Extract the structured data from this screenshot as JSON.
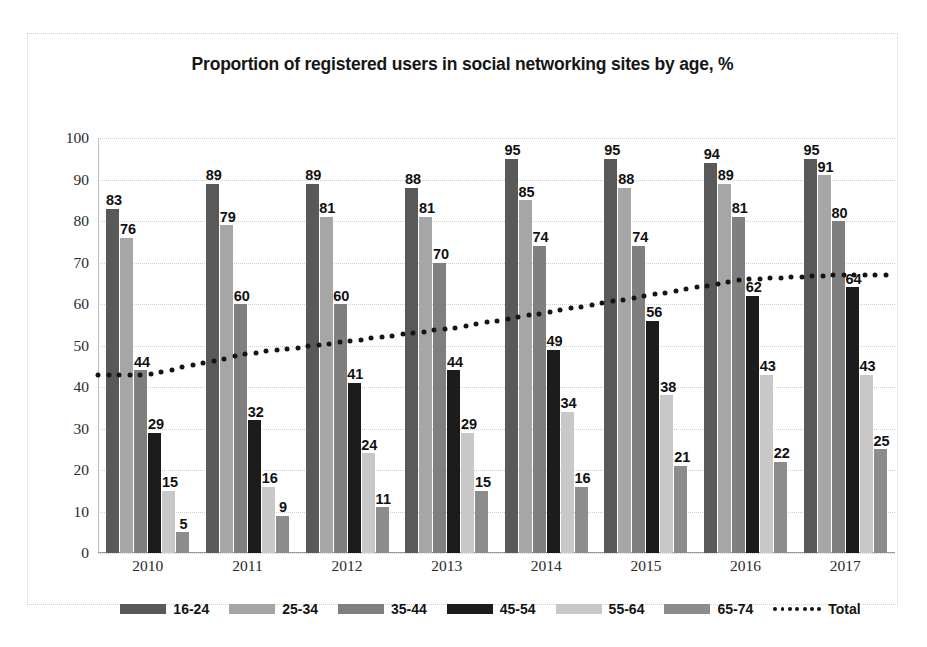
{
  "chart_data": {
    "type": "bar",
    "title": "Proportion of registered users in social networking sites by age, %",
    "xlabel": "",
    "ylabel": "",
    "ylim": [
      0,
      100
    ],
    "ytick_step": 10,
    "grid": true,
    "legend_position": "bottom",
    "categories": [
      "2010",
      "2011",
      "2012",
      "2013",
      "2014",
      "2015",
      "2016",
      "2017"
    ],
    "series": [
      {
        "name": "16-24",
        "color": "#595959",
        "values": [
          83,
          89,
          89,
          88,
          95,
          95,
          94,
          95
        ]
      },
      {
        "name": "25-34",
        "color": "#a6a6a6",
        "values": [
          76,
          79,
          81,
          81,
          85,
          88,
          89,
          91
        ]
      },
      {
        "name": "35-44",
        "color": "#7f7f7f",
        "values": [
          44,
          60,
          60,
          70,
          74,
          74,
          81,
          80
        ]
      },
      {
        "name": "45-54",
        "color": "#1c1c1c",
        "values": [
          29,
          32,
          41,
          44,
          49,
          56,
          62,
          64
        ]
      },
      {
        "name": "55-64",
        "color": "#c8c8c8",
        "values": [
          15,
          16,
          24,
          29,
          34,
          38,
          43,
          43
        ]
      },
      {
        "name": "65-74",
        "color": "#8c8c8c",
        "values": [
          5,
          9,
          11,
          15,
          16,
          21,
          22,
          25
        ]
      }
    ],
    "total_line": {
      "name": "Total",
      "style": "dotted",
      "color": "#151515",
      "values": [
        43,
        48,
        51,
        54,
        58,
        62,
        66,
        67
      ]
    },
    "ytick_labels": [
      "100",
      "90",
      "80",
      "70",
      "60",
      "50",
      "40",
      "30",
      "20",
      "10",
      "0"
    ]
  },
  "caption": {
    "text": ""
  }
}
